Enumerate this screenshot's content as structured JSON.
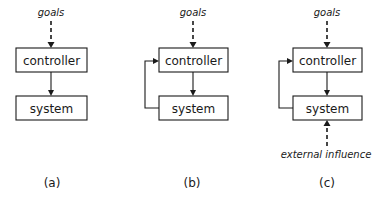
{
  "diagrams": [
    {
      "id": "a",
      "caption": "(a)",
      "goals_label": "goals",
      "controller_label": "controller",
      "system_label": "system",
      "feedback": false,
      "external_influence": null
    },
    {
      "id": "b",
      "caption": "(b)",
      "goals_label": "goals",
      "controller_label": "controller",
      "system_label": "system",
      "feedback": true,
      "external_influence": null
    },
    {
      "id": "c",
      "caption": "(c)",
      "goals_label": "goals",
      "controller_label": "controller",
      "system_label": "system",
      "feedback": true,
      "external_influence": "external influence"
    }
  ],
  "colors": {
    "stroke": "#1a1a1a",
    "background": "#ffffff"
  }
}
